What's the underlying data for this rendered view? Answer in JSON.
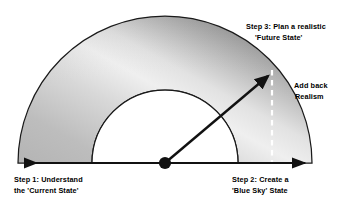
{
  "diagram": {
    "title_present": false,
    "geometry": {
      "center_x": 165,
      "center_y": 163,
      "outer_radius": 147,
      "inner_radius": 73,
      "baseline_left_x": 20,
      "baseline_right_x": 310,
      "arrow_tip_x": 272,
      "arrow_tip_y": 72,
      "dashed_line_x": 272
    },
    "colors": {
      "stroke": "#1a1a1a",
      "band_light": "#f2f2f2",
      "band_mid": "#b0b0b0",
      "band_dark": "#8a8a8a",
      "band_darkest": "#7a7a7a",
      "inner_fill": "#ffffff",
      "dashed_line": "#ffffff",
      "background": "#ffffff",
      "text": "#000000"
    },
    "labels": {
      "step3": {
        "line1": "Step 3: Plan a realistic",
        "line2": "'Future State'"
      },
      "add_back_realism": {
        "line1": "Add back",
        "line2": "Realism"
      },
      "step1": {
        "line1": "Step 1: Understand",
        "line2": "the 'Current State'"
      },
      "step2": {
        "line1": "Step 2: Create a",
        "line2": "'Blue Sky' State"
      }
    },
    "elements": {
      "outer_arc_name": "outer-semicircle-arc",
      "inner_arc_name": "inner-semicircle-arc",
      "baseline_name": "horizontal-double-arrow-axis",
      "pivot_name": "center-pivot-dot",
      "diagonal_arrow_name": "future-state-arrow",
      "dashed_name": "realism-dashed-line"
    }
  }
}
